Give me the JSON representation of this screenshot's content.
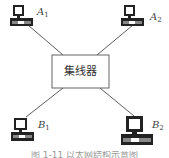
{
  "hub": {
    "label": "集线器"
  },
  "nodes": [
    {
      "id": "A1",
      "letter": "A",
      "subscript": "1"
    },
    {
      "id": "A2",
      "letter": "A",
      "subscript": "2"
    },
    {
      "id": "B1",
      "letter": "B",
      "subscript": "1"
    },
    {
      "id": "B2",
      "letter": "B",
      "subscript": "2"
    }
  ],
  "caption": "图 1-11  以太网结构示意图",
  "colors": {
    "line": "#333333",
    "box_border": "#555555",
    "computer": "#222222"
  }
}
